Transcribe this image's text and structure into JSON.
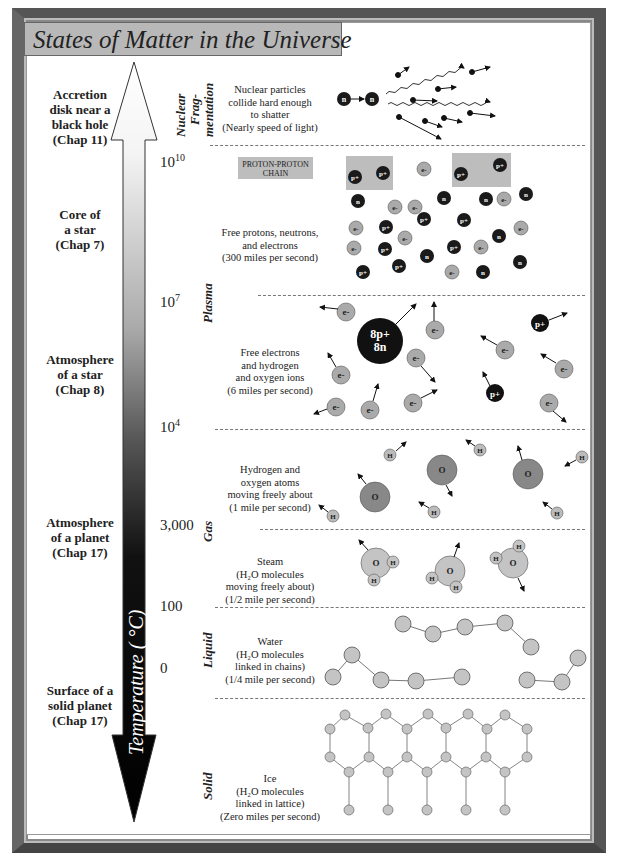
{
  "title": "States of Matter in the Universe",
  "axis": {
    "label": "Temperature ( °C)",
    "ticks": [
      {
        "base": "10",
        "exp": "10",
        "y": 160
      },
      {
        "base": "10",
        "exp": "7",
        "y": 300
      },
      {
        "base": "10",
        "exp": "4",
        "y": 425
      },
      {
        "base": "3,000",
        "exp": "",
        "y": 520
      },
      {
        "base": "100",
        "exp": "",
        "y": 600
      },
      {
        "base": "0",
        "exp": "",
        "y": 663
      }
    ]
  },
  "locations": [
    {
      "lines": [
        "Accretion",
        "disk near a",
        "black hole",
        "(Chap 11)"
      ],
      "y": 92
    },
    {
      "lines": [
        "Core of",
        "a star",
        "(Chap 7)"
      ],
      "y": 205
    },
    {
      "lines": [
        "Atmosphere",
        "of a star",
        "(Chap 8)"
      ],
      "y": 352
    },
    {
      "lines": [
        "Atmosphere",
        "of a planet",
        "(Chap 17)"
      ],
      "y": 518
    },
    {
      "lines": [
        "Surface of a",
        "solid planet",
        "(Chap 17)"
      ],
      "y": 680
    }
  ],
  "states": [
    {
      "label": "Nuclear",
      "label2": "Frag-",
      "label3": "mentation"
    },
    {
      "label": "Plasma"
    },
    {
      "label": "Gas"
    },
    {
      "label": "Liquid"
    },
    {
      "label": "Solid"
    }
  ],
  "descriptions": [
    {
      "lines": [
        "Nuclear particles",
        "collide hard enough",
        "to shatter",
        "(Nearly speed of light)"
      ]
    },
    {
      "lines": [
        "Free protons, neutrons,",
        "and electrons",
        "(300 miles per second)"
      ]
    },
    {
      "lines": [
        "Free electrons",
        "and hydrogen",
        "and oxygen ions",
        "(6 miles per second)"
      ]
    },
    {
      "lines": [
        "Hydrogen and",
        "oxygen atoms",
        "moving freely about",
        "(1 mile per second)"
      ]
    },
    {
      "lines": [
        "Steam",
        "(H₂O molecules",
        "moving freely about)",
        "(1/2 mile per second)"
      ]
    },
    {
      "lines": [
        "Water",
        "(H₂O molecules",
        "linked in chains)",
        "(1/4 mile per second)"
      ]
    },
    {
      "lines": [
        "Ice",
        "(H₂O molecules",
        "linked in lattice)",
        "(Zero miles per second)"
      ]
    }
  ],
  "proton_proton_label": [
    "PROTON-PROTON",
    "CHAIN"
  ],
  "particles": {
    "neutron": "n",
    "proton": "p+",
    "electron": "e-",
    "oxygen_nucleus": [
      "8p+",
      "8n"
    ],
    "hydrogen": "H",
    "oxygen": "O"
  },
  "colors": {
    "title_bg": "#b8b8b8",
    "dark_particle": "#1a1a1a",
    "electron": "#aaaaaa",
    "oxygen_atom": "#888888",
    "molecule": "#c4c4c4",
    "pp_box": "#bdbdbd"
  }
}
